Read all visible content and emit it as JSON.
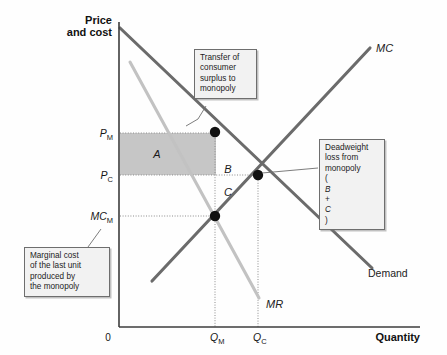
{
  "figure": {
    "kind": "economics-diagram",
    "background_color": "#fefefe"
  },
  "axes": {
    "y_axis_label_line1": "Price",
    "y_axis_label_line2": "and cost",
    "x_axis_label": "Quantity",
    "origin_label": "0",
    "y_ticks": [
      {
        "id": "pm",
        "base": "P",
        "sub": "M",
        "y": 133
      },
      {
        "id": "pc",
        "base": "P",
        "sub": "C",
        "y": 175
      },
      {
        "id": "mcm",
        "base": "MC",
        "sub": "M",
        "y": 216
      }
    ],
    "x_ticks": [
      {
        "id": "qm",
        "base": "Q",
        "sub": "M",
        "x": 215
      },
      {
        "id": "qc",
        "base": "Q",
        "sub": "C",
        "x": 258
      }
    ]
  },
  "curves": [
    {
      "id": "demand",
      "label": "Demand",
      "color": "#6b6b6b",
      "style": "plain",
      "x1": 120,
      "y1": 28,
      "x2": 372,
      "y2": 268
    },
    {
      "id": "mc",
      "label": "MC",
      "color": "#6b6b6b",
      "style": "italic",
      "x1": 152,
      "y1": 281,
      "x2": 370,
      "y2": 48
    },
    {
      "id": "mr",
      "label": "MR",
      "color": "#c2c2c2",
      "style": "italic",
      "x1": 130,
      "y1": 62,
      "x2": 259,
      "y2": 298
    }
  ],
  "curve_label_positions": {
    "demand": {
      "x": 368,
      "y": 276
    },
    "mc": {
      "x": 376,
      "y": 52
    },
    "mr": {
      "x": 266,
      "y": 307
    }
  },
  "points": [
    {
      "id": "monopoly-point",
      "x": 215,
      "y": 132
    },
    {
      "id": "competitive-point",
      "x": 258,
      "y": 175
    },
    {
      "id": "marginal-cost-point",
      "x": 215,
      "y": 216
    }
  ],
  "shaded_region": {
    "id": "transfer-rectangle",
    "label": "A",
    "color": "#c6c6c6",
    "x": 120,
    "y": 133,
    "width": 96,
    "height": 42,
    "label_x": 157,
    "label_y": 157
  },
  "region_labels": [
    {
      "id": "region-a",
      "text": "A",
      "x": 157,
      "y": 157
    },
    {
      "id": "region-b",
      "text": "B",
      "x": 227,
      "y": 172
    },
    {
      "id": "region-c",
      "text": "C",
      "x": 227,
      "y": 195
    }
  ],
  "callouts": {
    "transfer": {
      "id": "callout-transfer",
      "lines": [
        "Transfer of",
        "consumer",
        "surplus to",
        "monopoly"
      ],
      "leader": {
        "x1": 200,
        "y1": 105,
        "x2": 186,
        "y2": 124
      }
    },
    "deadweight": {
      "id": "callout-deadweight",
      "lines": [
        "Deadweight",
        "loss from",
        "monopoly"
      ],
      "formula_prefix": "(",
      "formula_b": "B",
      "formula_plus": " + ",
      "formula_c": "C",
      "formula_suffix": ")",
      "leader": {
        "x1": 319,
        "y1": 168,
        "x2": 262,
        "y2": 172
      }
    },
    "marginal": {
      "id": "callout-marginal",
      "lines": [
        "Marginal cost",
        "of the last unit",
        "produced by",
        "the monopoly"
      ],
      "leader": {
        "x1": 85,
        "y1": 247,
        "x2": 101,
        "y2": 228
      }
    }
  },
  "colors": {
    "axis": "#3d3d3d",
    "curve_dark": "#6b6b6b",
    "curve_light": "#c2c2c2",
    "shade": "#c6c6c6",
    "guide_dotted": "#8c8c8c",
    "callout_bg": "#f2f2f2",
    "callout_border": "#6e6e6e"
  },
  "geometry": {
    "axis_x": 119,
    "axis_y": 327,
    "axis_top": 22,
    "axis_right": 420
  }
}
